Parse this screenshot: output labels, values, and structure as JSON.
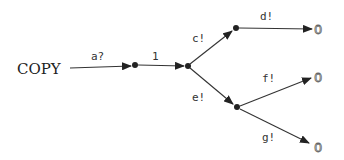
{
  "diagram": {
    "type": "process-tree",
    "process_name": "COPY",
    "terminal_symbol": "0",
    "edges": [
      {
        "id": "e-a",
        "label": "a?",
        "from": "COPY",
        "to": "n1"
      },
      {
        "id": "e-1",
        "label": "1",
        "from": "n1",
        "to": "n2"
      },
      {
        "id": "e-c",
        "label": "c!",
        "from": "n2",
        "to": "n3"
      },
      {
        "id": "e-e",
        "label": "e!",
        "from": "n2",
        "to": "n4"
      },
      {
        "id": "e-d",
        "label": "d!",
        "from": "n3",
        "to": "t1"
      },
      {
        "id": "e-f",
        "label": "f!",
        "from": "n4",
        "to": "t2"
      },
      {
        "id": "e-g",
        "label": "g!",
        "from": "n4",
        "to": "t3"
      }
    ],
    "labels": {
      "a": "a?",
      "one": "1",
      "c": "c!",
      "d": "d!",
      "e": "e!",
      "f": "f!",
      "g": "g!"
    },
    "terminals": [
      "0",
      "0",
      "0"
    ]
  }
}
